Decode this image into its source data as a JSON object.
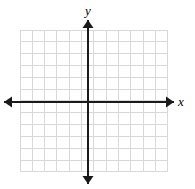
{
  "figure": {
    "type": "coordinate-plane",
    "title": "",
    "background_color": "#ffffff"
  },
  "axes": {
    "x_label": "x",
    "y_label": "y",
    "axis_color": "#1a1a1a",
    "axis_line_width": 2,
    "arrowheads": [
      "left",
      "right",
      "up",
      "down"
    ],
    "origin_px": {
      "x": 88,
      "y": 102
    },
    "x_axis_y_px": 102,
    "y_axis_x_px": 88,
    "x_axis_start_px": 4,
    "x_axis_end_px": 174,
    "y_axis_start_px": 20,
    "y_axis_end_px": 184,
    "tick_labels_x": [],
    "tick_labels_y": [],
    "x_range_units": [
      -6,
      6
    ],
    "y_range_units": [
      -6,
      6
    ]
  },
  "grid": {
    "color": "#d8d8d8",
    "line_width": 1,
    "columns": 12,
    "rows": 12,
    "columns_left_of_y_axis": 6,
    "columns_right_of_y_axis": 6,
    "rows_above_x_axis": 6,
    "rows_below_x_axis": 6,
    "left_px": 20,
    "top_px": 30,
    "right_px": 168,
    "bottom_px": 172,
    "cell_width_px": 12.333,
    "cell_height_px": 11.833
  },
  "chart_data": {
    "type": "scatter",
    "title": "",
    "xlabel": "x",
    "ylabel": "y",
    "xlim": [
      -6,
      6
    ],
    "ylim": [
      -6,
      6
    ],
    "xticks": [
      -6,
      -5,
      -4,
      -3,
      -2,
      -1,
      0,
      1,
      2,
      3,
      4,
      5,
      6
    ],
    "yticks": [
      -6,
      -5,
      -4,
      -3,
      -2,
      -1,
      0,
      1,
      2,
      3,
      4,
      5,
      6
    ],
    "xticklabels": [],
    "yticklabels": [],
    "grid": true,
    "legend": null,
    "series": [],
    "annotations": []
  }
}
